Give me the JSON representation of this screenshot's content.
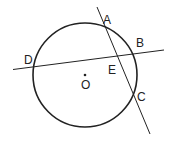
{
  "diagram": {
    "type": "geometry",
    "points": {
      "A": "A",
      "B": "B",
      "C": "C",
      "D": "D",
      "E": "E",
      "O": "O"
    },
    "colors": {
      "stroke": "#222222",
      "background": "#ffffff"
    }
  }
}
